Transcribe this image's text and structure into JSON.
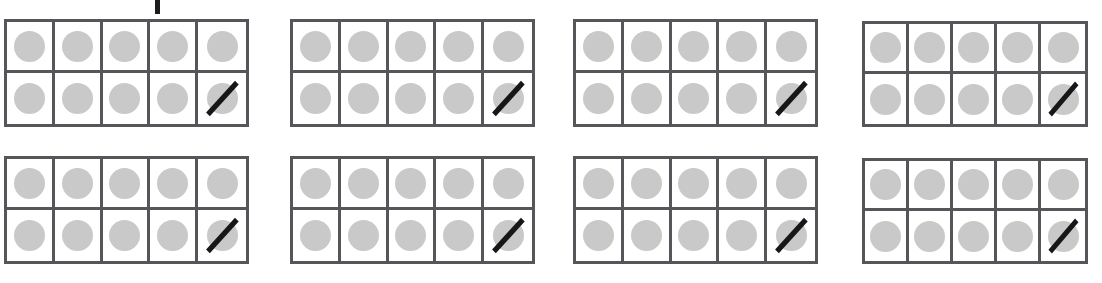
{
  "worksheet": {
    "title": "Ten Frame Subtraction Worksheet",
    "description": "Eight ten-frames, each with ten gray counters, with the last counter crossed out",
    "canvas": {
      "width": 1102,
      "height": 283
    },
    "colors": {
      "page_background": "#ffffff",
      "frame_border": "#55565a",
      "counter_fill": "#c9c9c9",
      "cross_out_stroke": "#17171a",
      "tick_mark": "#1d1d1d"
    },
    "tick_mark": {
      "name": "pencil-tick-mark",
      "x": 155,
      "y": 0,
      "width": 5,
      "height": 14
    },
    "frame_defaults": {
      "rows": 2,
      "columns": 5,
      "total_cells": 10,
      "counters_shown": 10,
      "counters_crossed_out": 1,
      "crossed_out_cell_index": 9,
      "cross_out_direction": "bottom-left-to-top-right"
    },
    "frames": [
      {
        "id": 1,
        "label": "ten-frame-1",
        "x": 4,
        "y": 19,
        "width": 245,
        "height": 108,
        "counters": 10,
        "crossed_out": 1,
        "remaining": 9
      },
      {
        "id": 2,
        "label": "ten-frame-2",
        "x": 290,
        "y": 19,
        "width": 245,
        "height": 108,
        "counters": 10,
        "crossed_out": 1,
        "remaining": 9
      },
      {
        "id": 3,
        "label": "ten-frame-3",
        "x": 573,
        "y": 19,
        "width": 245,
        "height": 108,
        "counters": 10,
        "crossed_out": 1,
        "remaining": 9
      },
      {
        "id": 4,
        "label": "ten-frame-4",
        "x": 862,
        "y": 21,
        "width": 226,
        "height": 106,
        "counters": 10,
        "crossed_out": 1,
        "remaining": 9
      },
      {
        "id": 5,
        "label": "ten-frame-5",
        "x": 4,
        "y": 156,
        "width": 245,
        "height": 108,
        "counters": 10,
        "crossed_out": 1,
        "remaining": 9
      },
      {
        "id": 6,
        "label": "ten-frame-6",
        "x": 290,
        "y": 156,
        "width": 245,
        "height": 108,
        "counters": 10,
        "crossed_out": 1,
        "remaining": 9
      },
      {
        "id": 7,
        "label": "ten-frame-7",
        "x": 573,
        "y": 156,
        "width": 245,
        "height": 108,
        "counters": 10,
        "crossed_out": 1,
        "remaining": 9
      },
      {
        "id": 8,
        "label": "ten-frame-8",
        "x": 862,
        "y": 158,
        "width": 226,
        "height": 106,
        "counters": 10,
        "crossed_out": 1,
        "remaining": 9
      }
    ]
  }
}
